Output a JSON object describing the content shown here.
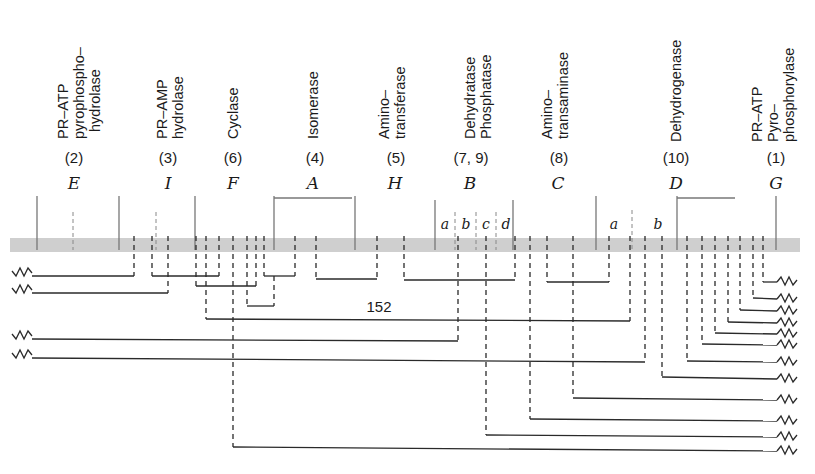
{
  "figure": {
    "type": "deletion map",
    "chromosome_color": "#cfcfcf",
    "line_color": "#2a2a2a",
    "genes": [
      {
        "letter": "E",
        "step": "(2)",
        "enzyme": [
          "PR–ATP",
          "pyrophospho–",
          "hydrolase"
        ],
        "x": 70
      },
      {
        "letter": "I",
        "step": "(3)",
        "enzyme": [
          "PR–AMP",
          "hydrolase"
        ],
        "x": 168
      },
      {
        "letter": "F",
        "step": "(6)",
        "enzyme": [
          "Cyclase"
        ],
        "x": 233
      },
      {
        "letter": "A",
        "step": "(4)",
        "enzyme": [
          "Isomerase"
        ],
        "x": 313
      },
      {
        "letter": "H",
        "step": "(5)",
        "enzyme": [
          "Amino–",
          "transferase"
        ],
        "x": 395
      },
      {
        "letter": "B",
        "step": "(7, 9)",
        "enzyme": [
          "Dehydratase",
          "Phosphatase"
        ],
        "x": 470
      },
      {
        "letter": "C",
        "step": "(8)",
        "enzyme": [
          "Amino–",
          "transaminase"
        ],
        "x": 558
      },
      {
        "letter": "D",
        "step": "(10)",
        "enzyme": [
          "Dehydrogenase"
        ],
        "x": 676
      },
      {
        "letter": "G",
        "step": "(1)",
        "enzyme": [
          "PR–ATP",
          "Pyro–",
          "phosphorylase"
        ],
        "x": 776
      }
    ],
    "sub_regions": [
      {
        "gene": "B",
        "labels": [
          "a",
          "b",
          "c",
          "d"
        ]
      },
      {
        "gene": "D",
        "labels": [
          "a",
          "b"
        ]
      }
    ],
    "annotation": "152",
    "left_deletions_count": 4,
    "right_deletions_count": 14
  }
}
